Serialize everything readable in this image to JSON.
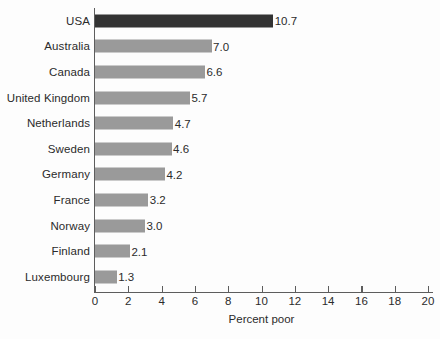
{
  "chart_data": {
    "type": "bar",
    "orientation": "horizontal",
    "title": "",
    "xlabel": "Percent poor",
    "ylabel": "",
    "xlim": [
      0,
      20
    ],
    "xticks": [
      0,
      2,
      4,
      6,
      8,
      10,
      12,
      14,
      16,
      18,
      20
    ],
    "xtick_labels": [
      "0",
      "2",
      "4",
      "6",
      "8",
      "10",
      "12",
      "14",
      "16",
      "18",
      "20"
    ],
    "grid": false,
    "legend": "none",
    "categories": [
      "USA",
      "Australia",
      "Canada",
      "United Kingdom",
      "Netherlands",
      "Sweden",
      "Germany",
      "France",
      "Norway",
      "Finland",
      "Luxembourg"
    ],
    "values": [
      10.7,
      7.0,
      6.6,
      5.7,
      4.7,
      4.6,
      4.2,
      3.2,
      3.0,
      2.1,
      1.3
    ],
    "value_labels": [
      "10.7",
      "7.0",
      "6.6",
      "5.7",
      "4.7",
      "4.6",
      "4.2",
      "3.2",
      "3.0",
      "2.1",
      "1.3"
    ],
    "highlight_index": 0,
    "colors": {
      "bar": "#9a9a9a",
      "bar_highlight": "#333333",
      "axis": "#5d5d5d",
      "text": "#2b2b2b",
      "background": "#fdfdfd"
    }
  }
}
